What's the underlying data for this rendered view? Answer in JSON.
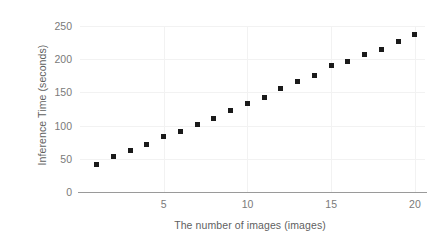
{
  "chart_data": {
    "type": "scatter",
    "title": "",
    "xlabel": "The number of images (images)",
    "ylabel": "Inference Time (seconds)",
    "x": [
      1,
      2,
      3,
      4,
      5,
      6,
      7,
      8,
      9,
      10,
      11,
      12,
      13,
      14,
      15,
      16,
      17,
      18,
      19,
      20
    ],
    "values": [
      42,
      53,
      63,
      72,
      84,
      91,
      101,
      111,
      123,
      134,
      143,
      156,
      167,
      175,
      190,
      196,
      207,
      215,
      226,
      237
    ],
    "series": [
      {
        "name": "Inference Time",
        "values": [
          42,
          53,
          63,
          72,
          84,
          91,
          101,
          111,
          123,
          134,
          143,
          156,
          167,
          175,
          190,
          196,
          207,
          215,
          226,
          237
        ]
      }
    ],
    "xlim": [
      0,
      20.6
    ],
    "ylim": [
      0,
      250
    ],
    "xticks": [
      5,
      10,
      15,
      20
    ],
    "yticks": [
      0,
      50,
      100,
      150,
      200,
      250
    ],
    "xtick_labels": [
      "5",
      "10",
      "15",
      "20"
    ],
    "ytick_labels": [
      "0",
      "50",
      "100",
      "150",
      "200",
      "250"
    ],
    "grid": true,
    "grid_color": "#f2f2f2",
    "legend": false,
    "legend_position": "none",
    "marker": "square",
    "marker_color": "#1a1a1a",
    "axis_color": "#9a9a9a",
    "tick_label_color": "#7a7a7a",
    "axis_title_color": "#5f5f5f",
    "background": "#ffffff"
  }
}
